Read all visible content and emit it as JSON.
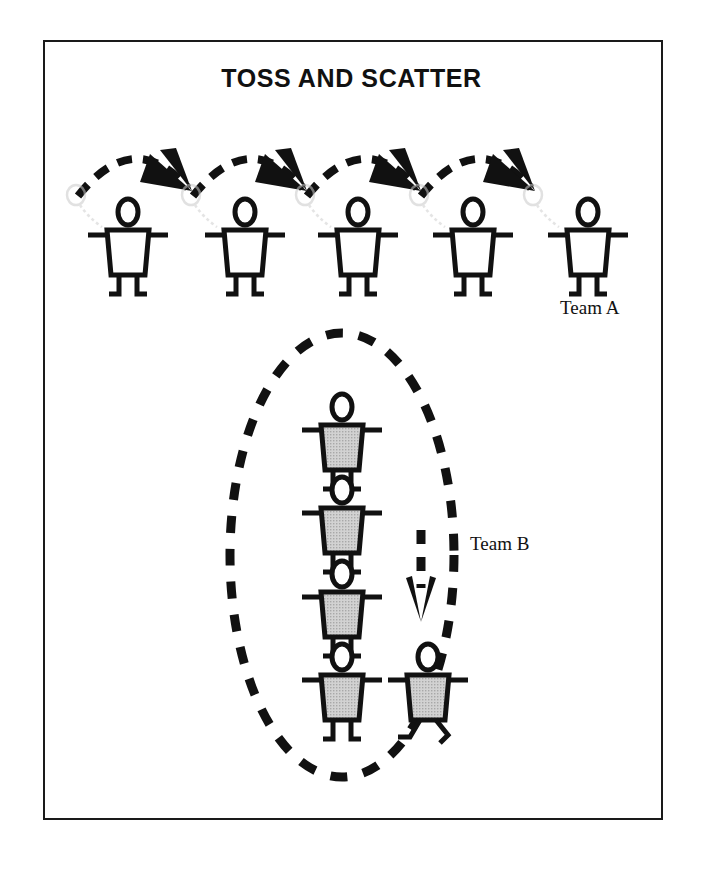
{
  "document": {
    "title": "TOSS AND SCATTER",
    "border_color": "#1a1a1a",
    "background_color": "#ffffff"
  },
  "labels": {
    "team_a": "Team A",
    "team_b": "Team B"
  },
  "diagram": {
    "type": "instructional-activity-diagram",
    "ink_color": "#111111",
    "figure_fill_team_a": "#ffffff",
    "figure_fill_team_b": "#c9c9c9",
    "trail_color": "#cccccc",
    "team_a": {
      "label": "Team A",
      "arrangement": "scattered-line",
      "figure_count": 5,
      "figures": [
        {
          "x": 128,
          "y": 200,
          "pose": "standing",
          "fill": "#ffffff"
        },
        {
          "x": 245,
          "y": 200,
          "pose": "standing",
          "fill": "#ffffff"
        },
        {
          "x": 358,
          "y": 200,
          "pose": "standing",
          "fill": "#ffffff"
        },
        {
          "x": 473,
          "y": 200,
          "pose": "standing",
          "fill": "#ffffff"
        },
        {
          "x": 588,
          "y": 200,
          "pose": "standing",
          "fill": "#ffffff"
        }
      ],
      "arcs": [
        {
          "from_x": 80,
          "to_x": 190,
          "peak_y": 140
        },
        {
          "from_x": 196,
          "to_x": 305,
          "peak_y": 140
        },
        {
          "from_x": 310,
          "to_x": 420,
          "peak_y": 140
        },
        {
          "from_x": 424,
          "to_x": 534,
          "peak_y": 140
        }
      ],
      "arc_style": "dashed-with-solid-arrowhead",
      "arrow_direction": "down-right"
    },
    "team_b": {
      "label": "Team B",
      "arrangement": "grouped-column-in-oval",
      "figure_count": 5,
      "oval": {
        "center_x": 342,
        "center_y": 555,
        "radius_x": 112,
        "radius_y": 222,
        "style": "dashed"
      },
      "figures": [
        {
          "x": 342,
          "y": 395,
          "pose": "standing",
          "fill": "#c9c9c9"
        },
        {
          "x": 342,
          "y": 478,
          "pose": "standing",
          "fill": "#c9c9c9"
        },
        {
          "x": 342,
          "y": 562,
          "pose": "standing",
          "fill": "#c9c9c9"
        },
        {
          "x": 342,
          "y": 645,
          "pose": "standing",
          "fill": "#c9c9c9"
        },
        {
          "x": 428,
          "y": 645,
          "pose": "running",
          "fill": "#c9c9c9"
        }
      ],
      "arrow": {
        "x": 421,
        "y_start": 540,
        "y_end": 618,
        "direction": "down",
        "style": "dashed-with-v-arrowhead"
      }
    }
  }
}
